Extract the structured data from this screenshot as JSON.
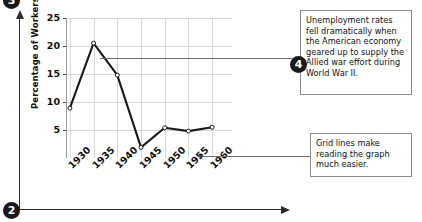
{
  "chart_data": {
    "type": "line",
    "title": "",
    "xlabel": "",
    "ylabel": "Percentage of Workers Unemployed",
    "categories": [
      "1930",
      "1935",
      "1940",
      "1945",
      "1950",
      "1955",
      "1960"
    ],
    "values": [
      8.9,
      20.5,
      14.8,
      1.9,
      5.4,
      4.8,
      5.5
    ],
    "ylim": [
      0,
      25
    ],
    "yticks": [
      25,
      20,
      15,
      10,
      5
    ],
    "xticks": [
      "1930",
      "1935",
      "1940",
      "1945",
      "1950",
      "1955",
      "1960"
    ],
    "grid": true,
    "legend": "none",
    "marker": "open-circle",
    "line_color": "#1a1a1a",
    "grid_color": "#d8d8d8"
  },
  "y_axis": {
    "title": "Percentage of Workers Unemployed",
    "ticks": [
      "25",
      "20",
      "15",
      "10",
      "5"
    ]
  },
  "x_axis": {
    "ticks": [
      "1930",
      "1935",
      "1940",
      "1945",
      "1950",
      "1955",
      "1960"
    ]
  },
  "badges": {
    "top_left": "3",
    "bottom_left": "2",
    "callout_one": "4"
  },
  "callouts": [
    {
      "id": "callout-unemployment",
      "text": "Unemployment rates fell dramatically when the American economy geared up to supply the Allied war effort during World War II."
    },
    {
      "id": "callout-gridlines",
      "text": "Grid lines make reading the graph much easier."
    }
  ],
  "colors": {
    "line": "#1a1a1a",
    "grid": "#d8d8d8",
    "badge_bg": "#1a1a1a",
    "badge_text": "#ffffff",
    "callout_border": "#8c8c8c",
    "leader": "#6f6f6f",
    "frame": "#2b2b2b"
  }
}
